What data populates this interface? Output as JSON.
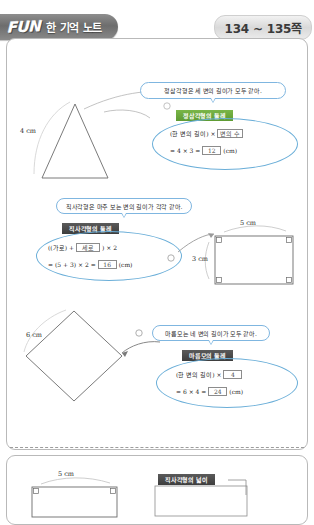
{
  "header": {
    "logo": "FUN",
    "title": "한 기억 노트",
    "page_range": "134 ~ 135쪽"
  },
  "sections": [
    {
      "id": "equilateral-triangle",
      "bubble": "정삼각형은 세 변의 길이가 모두 같아.",
      "band": "정삼각형의 둘레",
      "shape": "triangle",
      "dims": [
        {
          "label": "4 cm"
        }
      ],
      "formula_line1_pre": "(한 변의 길이) ×",
      "formula_line1_box": "변의 수",
      "formula_line2_pre": "= 4 × 3 =",
      "formula_line2_box": "12",
      "formula_line2_unit": "(cm)"
    },
    {
      "id": "rectangle-perimeter",
      "bubble": "직사각형은 마주 보는 변의 길이가 각각 같아.",
      "band": "직사각형의 둘레",
      "shape": "rectangle",
      "dims": [
        {
          "label": "5 cm"
        },
        {
          "label": "3 cm"
        }
      ],
      "formula_line1_pre": "((가로) +",
      "formula_line1_box": "세로",
      "formula_line1_post": ") × 2",
      "formula_line2_pre": "= (5 + 3) × 2 =",
      "formula_line2_box": "16",
      "formula_line2_unit": "(cm)"
    },
    {
      "id": "rhombus-perimeter",
      "bubble": "마름모는 네 변의 길이가 모두 같아.",
      "band": "마름모의 둘레",
      "shape": "rhombus",
      "dims": [
        {
          "label": "6 cm"
        }
      ],
      "formula_line1_pre": "(한 변의 길이) ×",
      "formula_line1_box": "4",
      "formula_line2_pre": "= 6 × 4 =",
      "formula_line2_box": "24",
      "formula_line2_unit": "(cm)"
    }
  ],
  "next_panel": {
    "band": "직사각형의 넓이",
    "dim": "5 cm"
  }
}
